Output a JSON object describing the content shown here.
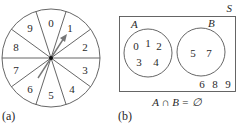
{
  "panel_a": {
    "caption": "(a)",
    "spinner": {
      "sector_labels": [
        "0",
        "1",
        "2",
        "3",
        "4",
        "5",
        "6",
        "7",
        "8",
        "9"
      ],
      "arrow": "pointer"
    }
  },
  "panel_b": {
    "caption": "(b)",
    "universe_label": "S",
    "set_a": {
      "label": "A",
      "elements": [
        "0",
        "1",
        "2",
        "3",
        "4"
      ]
    },
    "set_b": {
      "label": "B",
      "elements": [
        "5",
        "7"
      ]
    },
    "outside_elements": [
      "6",
      "8",
      "9"
    ],
    "formula": "A ∩ B = ∅"
  },
  "colors": {
    "stroke": "#555555",
    "text": "#2a2a2a",
    "arrow": "#777777"
  }
}
